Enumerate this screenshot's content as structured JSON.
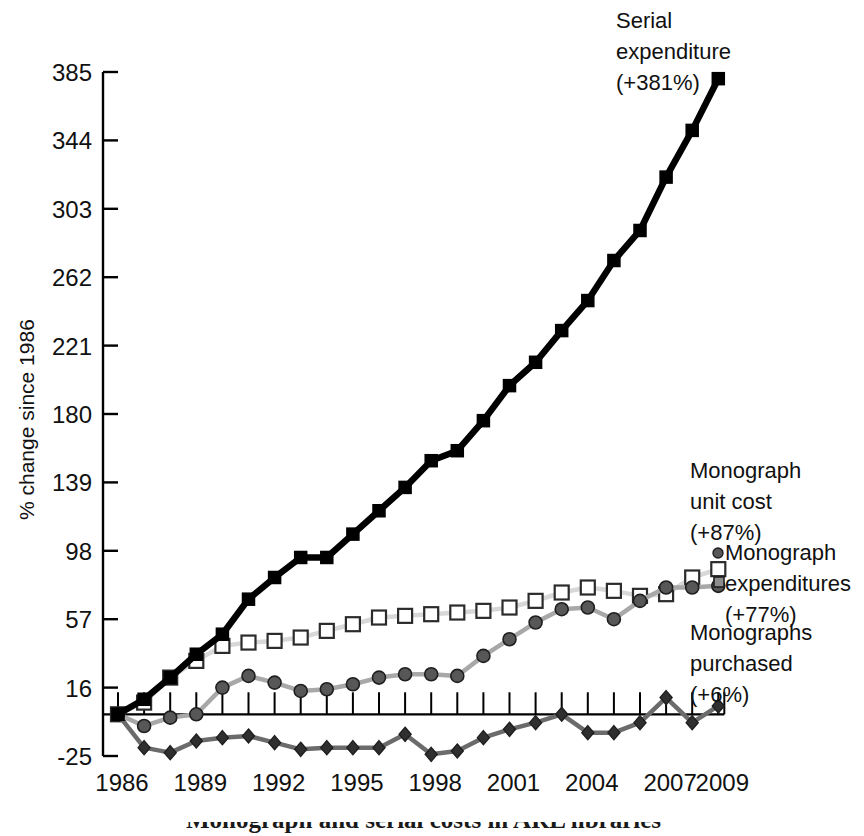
{
  "chart_data": {
    "type": "line",
    "title": "",
    "xlabel": "",
    "ylabel": "% change since 1986",
    "ylim": [
      -25,
      385
    ],
    "xlim": [
      1986,
      2009
    ],
    "grid": false,
    "legend_position": "inline-annotations",
    "ytick_labels": [
      "385",
      "344",
      "303",
      "262",
      "221",
      "180",
      "139",
      "98",
      "57",
      "16",
      "-25"
    ],
    "ytick_values": [
      385,
      344,
      303,
      262,
      221,
      180,
      139,
      98,
      57,
      16,
      -25
    ],
    "xtick_labels": [
      "1986",
      "1989",
      "1992",
      "1995",
      "1998",
      "2001",
      "2004",
      "2007",
      "2009"
    ],
    "xtick_values": [
      1986,
      1989,
      1992,
      1995,
      1998,
      2001,
      2004,
      2007,
      2009
    ],
    "x": [
      1986,
      1987,
      1988,
      1989,
      1990,
      1991,
      1992,
      1993,
      1994,
      1995,
      1996,
      1997,
      1998,
      1999,
      2000,
      2001,
      2002,
      2003,
      2004,
      2005,
      2006,
      2007,
      2008,
      2009
    ],
    "series": [
      {
        "name": "Serial expenditure",
        "marker": "filled-square",
        "color": "#000000",
        "line_color": "#000000",
        "values": [
          0,
          9,
          22,
          36,
          48,
          69,
          82,
          94,
          94,
          108,
          122,
          136,
          152,
          158,
          176,
          197,
          211,
          230,
          248,
          272,
          290,
          322,
          350,
          381
        ]
      },
      {
        "name": "Monograph unit cost",
        "marker": "open-square",
        "color": "#ffffff",
        "line_color": "#d8d8d8",
        "values": [
          0,
          7,
          22,
          32,
          41,
          43,
          44,
          46,
          50,
          54,
          58,
          59,
          60,
          61,
          62,
          64,
          68,
          73,
          76,
          74,
          71,
          72,
          82,
          87
        ]
      },
      {
        "name": "Monograph expenditures",
        "marker": "filled-circle",
        "color": "#575757",
        "line_color": "#a8a8a8",
        "values": [
          0,
          -7,
          -2,
          0,
          16,
          23,
          19,
          14,
          15,
          18,
          22,
          24,
          24,
          23,
          35,
          45,
          55,
          63,
          64,
          57,
          68,
          76,
          76,
          77
        ]
      },
      {
        "name": "Monographs purchased",
        "marker": "filled-diamond",
        "color": "#2f2f2f",
        "line_color": "#6b6b6b",
        "values": [
          0,
          -20,
          -23,
          -16,
          -14,
          -13,
          -17,
          -21,
          -20,
          -20,
          -20,
          -12,
          -24,
          -22,
          -14,
          -9,
          -5,
          0,
          -11,
          -11,
          -5,
          10,
          -5,
          5
        ]
      }
    ],
    "annotations": [
      {
        "name": "serial-expenditure-annotation",
        "lines": [
          "Serial",
          "expenditure",
          "(+381%)"
        ],
        "x": 616,
        "y": 28,
        "anchor": "start"
      },
      {
        "name": "monograph-unit-cost-annotation",
        "lines": [
          "Monograph",
          "unit cost",
          "(+87%)"
        ],
        "x": 690,
        "y": 478,
        "anchor": "start"
      },
      {
        "name": "monograph-expenditures-annotation",
        "lines": [
          "Monograph",
          "expenditures",
          "(+77%)"
        ],
        "x": 725,
        "y": 560,
        "anchor": "start"
      },
      {
        "name": "monographs-purchased-annotation",
        "lines": [
          "Monographs",
          "purchased",
          "(+6%)"
        ],
        "x": 690,
        "y": 640,
        "anchor": "start"
      }
    ]
  },
  "caption": {
    "text": "Monograph and serial costs in ARL libraries"
  }
}
